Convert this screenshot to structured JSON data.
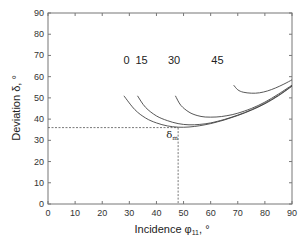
{
  "chart_data": {
    "type": "line",
    "title": "",
    "xlabel": "Incidence φ₁₁, °",
    "ylabel": "Deviation δ, °",
    "xlim": [
      0,
      90
    ],
    "ylim": [
      0,
      90
    ],
    "xticks": [
      0,
      10,
      20,
      30,
      40,
      50,
      60,
      70,
      80,
      90
    ],
    "yticks": [
      0,
      10,
      20,
      30,
      40,
      50,
      60,
      70,
      80,
      90
    ],
    "grid": false,
    "legend": "none (curves labelled inline)",
    "series": [
      {
        "name": "0",
        "label_pos": [
          29,
          66
        ],
        "x": [
          28,
          32,
          36,
          40,
          44,
          48,
          52,
          56,
          60,
          65,
          70,
          75,
          80,
          85,
          90
        ],
        "y": [
          51,
          44.5,
          40.5,
          38.2,
          36.8,
          36.2,
          36.3,
          36.9,
          37.9,
          39.6,
          41.7,
          44.2,
          47.2,
          51,
          55.5
        ]
      },
      {
        "name": "15",
        "label_pos": [
          34.5,
          66
        ],
        "x": [
          33,
          36,
          40,
          44,
          48,
          52,
          56,
          60,
          65,
          70,
          75,
          80,
          85,
          90
        ],
        "y": [
          51,
          45.5,
          41.5,
          39.3,
          37.9,
          37.3,
          37.5,
          38.2,
          39.8,
          41.9,
          44.4,
          47.5,
          51.2,
          55.7
        ]
      },
      {
        "name": "30",
        "label_pos": [
          46.5,
          66
        ],
        "x": [
          47,
          49,
          52,
          55,
          58,
          62,
          66,
          70,
          75,
          80,
          85,
          90
        ],
        "y": [
          51,
          46.5,
          43.3,
          41.7,
          41,
          41,
          41.6,
          42.8,
          45,
          48,
          51.8,
          56
        ]
      },
      {
        "name": "45",
        "label_pos": [
          62.5,
          66
        ],
        "x": [
          68.5,
          70,
          72,
          75,
          78,
          81,
          84,
          87,
          90
        ],
        "y": [
          56,
          53.8,
          52.7,
          52.2,
          52.4,
          53.3,
          54.7,
          56.5,
          58.5
        ]
      }
    ],
    "annotations": [
      {
        "text": "δm",
        "x": 48,
        "y": 36,
        "note": "minimum deviation, dashed guide lines"
      }
    ],
    "guide_lines": {
      "horizontal_y": 36,
      "vertical_x": 48
    }
  },
  "labels": {
    "xlabel_main": "Incidence φ",
    "xlabel_sub": "11",
    "xlabel_suffix": ", °",
    "ylabel_main": "Deviation δ",
    "ylabel_suffix": ", °",
    "annot_main": "δ",
    "annot_sub": "m"
  }
}
